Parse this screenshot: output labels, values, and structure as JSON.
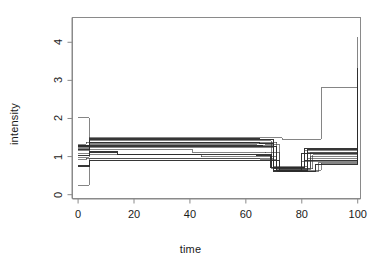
{
  "chart_data": {
    "type": "line",
    "subtype": "step",
    "title": "",
    "xlabel": "time",
    "ylabel": "intensity",
    "xlim": [
      -2,
      101
    ],
    "ylim": [
      -0.1,
      4.65
    ],
    "xticks": [
      0,
      20,
      40,
      60,
      80,
      100
    ],
    "yticks": [
      0,
      1,
      2,
      3,
      4
    ],
    "grid": false,
    "legend": null,
    "frame": true,
    "step_type": "hv",
    "note": "Overlapping piecewise-constant intensity step functions",
    "series": [
      {
        "name": "trace-1",
        "x": [
          0,
          4,
          73,
          87,
          100
        ],
        "values": [
          2.02,
          1.5,
          1.45,
          2.8,
          4.15
        ]
      },
      {
        "name": "trace-2",
        "x": [
          0,
          4,
          65,
          70,
          82,
          100
        ],
        "values": [
          1.28,
          1.46,
          1.44,
          0.62,
          1.18,
          3.32
        ]
      },
      {
        "name": "trace-3",
        "x": [
          0,
          4,
          64,
          69,
          81,
          100
        ],
        "values": [
          1.22,
          1.42,
          1.41,
          0.7,
          1.15,
          3.1
        ]
      },
      {
        "name": "trace-4",
        "x": [
          0,
          3,
          66,
          71,
          83,
          100
        ],
        "values": [
          1.32,
          1.38,
          1.37,
          0.66,
          1.1,
          2.88
        ]
      },
      {
        "name": "trace-5",
        "x": [
          0,
          4,
          65,
          70,
          81,
          100
        ],
        "values": [
          1.3,
          1.36,
          1.35,
          0.72,
          1.22,
          2.8
        ]
      },
      {
        "name": "trace-6",
        "x": [
          0,
          4,
          67,
          72,
          84,
          100
        ],
        "values": [
          1.26,
          1.34,
          1.33,
          0.68,
          1.05,
          2.72
        ]
      },
      {
        "name": "trace-7",
        "x": [
          0,
          4,
          64,
          70,
          82,
          100
        ],
        "values": [
          1.24,
          1.31,
          1.3,
          0.75,
          1.12,
          2.62
        ]
      },
      {
        "name": "trace-8",
        "x": [
          0,
          4,
          66,
          71,
          80,
          100
        ],
        "values": [
          1.18,
          1.28,
          1.27,
          0.64,
          1.08,
          2.52
        ]
      },
      {
        "name": "trace-9",
        "x": [
          0,
          4,
          65,
          70,
          83,
          100
        ],
        "values": [
          1.15,
          1.25,
          1.24,
          0.7,
          1.0,
          2.48
        ]
      },
      {
        "name": "trace-10",
        "x": [
          0,
          4,
          41,
          67,
          72,
          82,
          100
        ],
        "values": [
          1.08,
          1.18,
          1.1,
          1.12,
          0.66,
          0.95,
          2.3
        ]
      },
      {
        "name": "trace-11",
        "x": [
          0,
          4,
          14,
          64,
          69,
          81,
          100
        ],
        "values": [
          1.02,
          1.12,
          1.05,
          1.04,
          0.72,
          0.9,
          2.22
        ]
      },
      {
        "name": "trace-12",
        "x": [
          0,
          4,
          44,
          66,
          71,
          86,
          100
        ],
        "values": [
          0.98,
          1.05,
          1.0,
          0.99,
          0.62,
          0.85,
          2.05
        ]
      },
      {
        "name": "trace-13",
        "x": [
          0,
          3,
          65,
          70,
          80,
          100
        ],
        "values": [
          0.92,
          0.96,
          0.95,
          0.68,
          0.88,
          1.95
        ]
      },
      {
        "name": "trace-14",
        "x": [
          0,
          4,
          66,
          72,
          85,
          100
        ],
        "values": [
          0.75,
          0.9,
          0.89,
          0.6,
          0.8,
          1.8
        ]
      },
      {
        "name": "trace-15",
        "x": [
          0,
          4,
          65,
          71,
          87,
          100
        ],
        "values": [
          0.25,
          0.94,
          0.93,
          0.64,
          0.82,
          2.0
        ]
      }
    ]
  },
  "axes": {
    "xlabel": "time",
    "ylabel": "intensity",
    "xtick_labels": [
      "0",
      "20",
      "40",
      "60",
      "80",
      "100"
    ],
    "ytick_labels": [
      "0",
      "1",
      "2",
      "3",
      "4"
    ]
  },
  "style": {
    "line_color": "#2b2b2b",
    "frame_color": "#8a8a8a",
    "text_color": "#1a1a1a",
    "background": "#ffffff"
  }
}
